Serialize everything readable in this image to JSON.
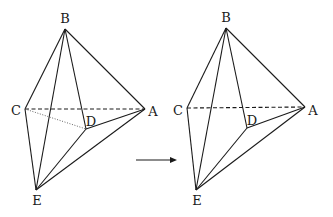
{
  "figure": {
    "colors": {
      "stroke": "#1a1a1a",
      "background": "#ffffff"
    },
    "left": {
      "labels": {
        "B": "B",
        "C": "C",
        "A": "A",
        "D": "D",
        "E": "E"
      },
      "hidden_edges": [
        "CA (dashed)",
        "CD (dotted)"
      ]
    },
    "right": {
      "labels": {
        "B": "B",
        "C": "C",
        "A": "A",
        "D": "D",
        "E": "E"
      },
      "hidden_edges": [
        "CA (dashed)"
      ]
    },
    "arrow": {
      "direction": "right-arrow-icon"
    }
  }
}
